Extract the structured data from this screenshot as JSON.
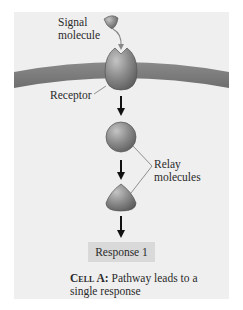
{
  "diagram": {
    "labels": {
      "signal_line1": "Signal",
      "signal_line2": "molecule",
      "receptor": "Receptor",
      "relay_line1": "Relay",
      "relay_line2": "molecules"
    },
    "response": "Response 1",
    "caption": {
      "bold": "Cell A:",
      "rest": " Pathway leads to a single response"
    },
    "colors": {
      "panel": "#efefef",
      "membrane": "#7a7a7a",
      "molecule": "#8a8a8a",
      "response_box": "#d9d9d9",
      "arrow": "#111111"
    }
  }
}
